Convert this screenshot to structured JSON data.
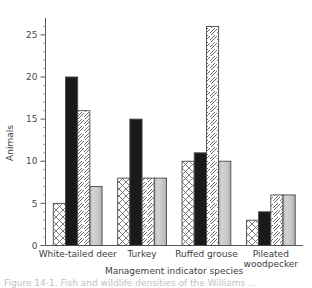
{
  "chart_data": {
    "type": "bar",
    "title": "",
    "xlabel": "Management indicator species",
    "ylabel": "Animals",
    "categories": [
      "White-tailed deer",
      "Turkey",
      "Ruffed grouse",
      "Pileated woodpecker"
    ],
    "series": [
      {
        "name": "series-1",
        "pattern": "crosshatch",
        "values": [
          5,
          8,
          10,
          3
        ]
      },
      {
        "name": "series-2",
        "pattern": "solid-black",
        "values": [
          20,
          15,
          11,
          4
        ]
      },
      {
        "name": "series-3",
        "pattern": "diagonal-hatch",
        "values": [
          16,
          8,
          26,
          6
        ]
      },
      {
        "name": "series-4",
        "pattern": "light-gray",
        "values": [
          7,
          8,
          10,
          6
        ]
      }
    ],
    "ylim": [
      0,
      27
    ],
    "yticks": [
      0,
      5,
      10,
      15,
      20,
      25
    ],
    "ytick_labels": [
      "0",
      "5",
      "10",
      "15",
      "20",
      "25"
    ],
    "minor_tick_step": 1,
    "grid": false,
    "legend": "none"
  },
  "axes": {
    "y_title": "Animals",
    "x_title": "Management indicator species"
  },
  "category_labels": [
    {
      "line1": "White-tailed deer",
      "line2": ""
    },
    {
      "line1": "Turkey",
      "line2": ""
    },
    {
      "line1": "Ruffed grouse",
      "line2": ""
    },
    {
      "line1": "Pileated",
      "line2": "woodpecker"
    }
  ],
  "caption": {
    "text": "Figure 14-1. Fish and wildlife densities of the Williams ..."
  },
  "colors": {
    "axis": "#5a5a5a",
    "text": "#3d3d3d",
    "bar_black": "#1a1a1a",
    "bar_gray": "#c9c9c9",
    "bar_outline": "#4a4a4a",
    "background": "#ffffff"
  }
}
